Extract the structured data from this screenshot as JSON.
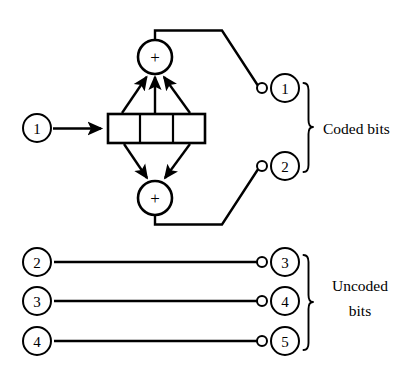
{
  "diagram": {
    "background_color": "#ffffff",
    "line_color": "#000000",
    "inputs": [
      {
        "label": "1",
        "name": "input-node-1",
        "cx": 37,
        "cy": 128,
        "r": 14
      },
      {
        "label": "2",
        "name": "input-node-2",
        "cx": 37,
        "cy": 262,
        "r": 14
      },
      {
        "label": "3",
        "name": "input-node-3",
        "cx": 37,
        "cy": 301,
        "r": 14
      },
      {
        "label": "4",
        "name": "input-node-4",
        "cx": 37,
        "cy": 341,
        "r": 14
      }
    ],
    "outputs": [
      {
        "label": "1",
        "name": "output-node-1",
        "cx": 285,
        "cy": 88,
        "r": 14,
        "term_cx": 262,
        "term_cy": 88,
        "term_r": 5
      },
      {
        "label": "2",
        "name": "output-node-2",
        "cx": 285,
        "cy": 166,
        "r": 14,
        "term_cx": 262,
        "term_cy": 166,
        "term_r": 5
      },
      {
        "label": "3",
        "name": "output-node-3",
        "cx": 285,
        "cy": 262,
        "r": 14,
        "term_cx": 262,
        "term_cy": 262,
        "term_r": 5
      },
      {
        "label": "4",
        "name": "output-node-4",
        "cx": 285,
        "cy": 301,
        "r": 14,
        "term_cx": 262,
        "term_cy": 301,
        "term_r": 5
      },
      {
        "label": "5",
        "name": "output-node-5",
        "cx": 285,
        "cy": 341,
        "r": 14,
        "term_cx": 262,
        "term_cy": 341,
        "term_r": 5
      }
    ],
    "adders": [
      {
        "symbol": "+",
        "name": "adder-top",
        "cx": 155,
        "cy": 57,
        "r": 17,
        "inputs_count": 3
      },
      {
        "symbol": "+",
        "name": "adder-bottom",
        "cx": 155,
        "cy": 198,
        "r": 17,
        "inputs_count": 2
      }
    ],
    "shift_register": {
      "name": "shift-register",
      "cells": 3,
      "x": 108,
      "y": 114,
      "width": 97,
      "height": 29,
      "dividers": [
        140,
        173
      ]
    },
    "groups": [
      {
        "name": "coded-bits-group",
        "label": "Coded bits",
        "lines": [
          "Coded bits"
        ],
        "brace_top": 82,
        "brace_bottom": 172,
        "brace_x": 306,
        "label_x": 326,
        "label_y": 127
      },
      {
        "name": "uncoded-bits-group",
        "label": "Uncoded bits",
        "lines": [
          "Uncoded",
          "bits"
        ],
        "brace_top": 254,
        "brace_bottom": 350,
        "brace_x": 306,
        "label_x": 358,
        "label_y": 292
      }
    ],
    "uncoded_wires": [
      {
        "name": "uncoded-wire-1",
        "y": 262,
        "x1": 54,
        "x2": 257
      },
      {
        "name": "uncoded-wire-2",
        "y": 301,
        "x1": 54,
        "x2": 257
      },
      {
        "name": "uncoded-wire-3",
        "y": 341,
        "x1": 54,
        "x2": 257
      }
    ]
  }
}
